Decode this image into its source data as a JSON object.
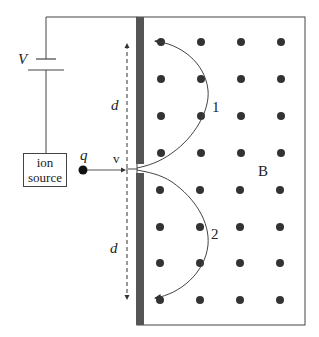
{
  "diagram": {
    "labels": {
      "voltage": "V",
      "ion_source_line1": "ion",
      "ion_source_line2": "source",
      "charge": "q",
      "velocity": "v",
      "distance_top": "d",
      "distance_bottom": "d",
      "field": "B",
      "path1": "1",
      "path2": "2"
    },
    "field": {
      "direction": "out of page (dots)",
      "columns_x": [
        161,
        200,
        241,
        281
      ],
      "rows_top_y": [
        42,
        79,
        116,
        153
      ],
      "rows_bottom_y": [
        190,
        227,
        263,
        300
      ]
    },
    "colors": {
      "plate": "#555555",
      "line": "#444444",
      "dot": "#333333"
    }
  }
}
